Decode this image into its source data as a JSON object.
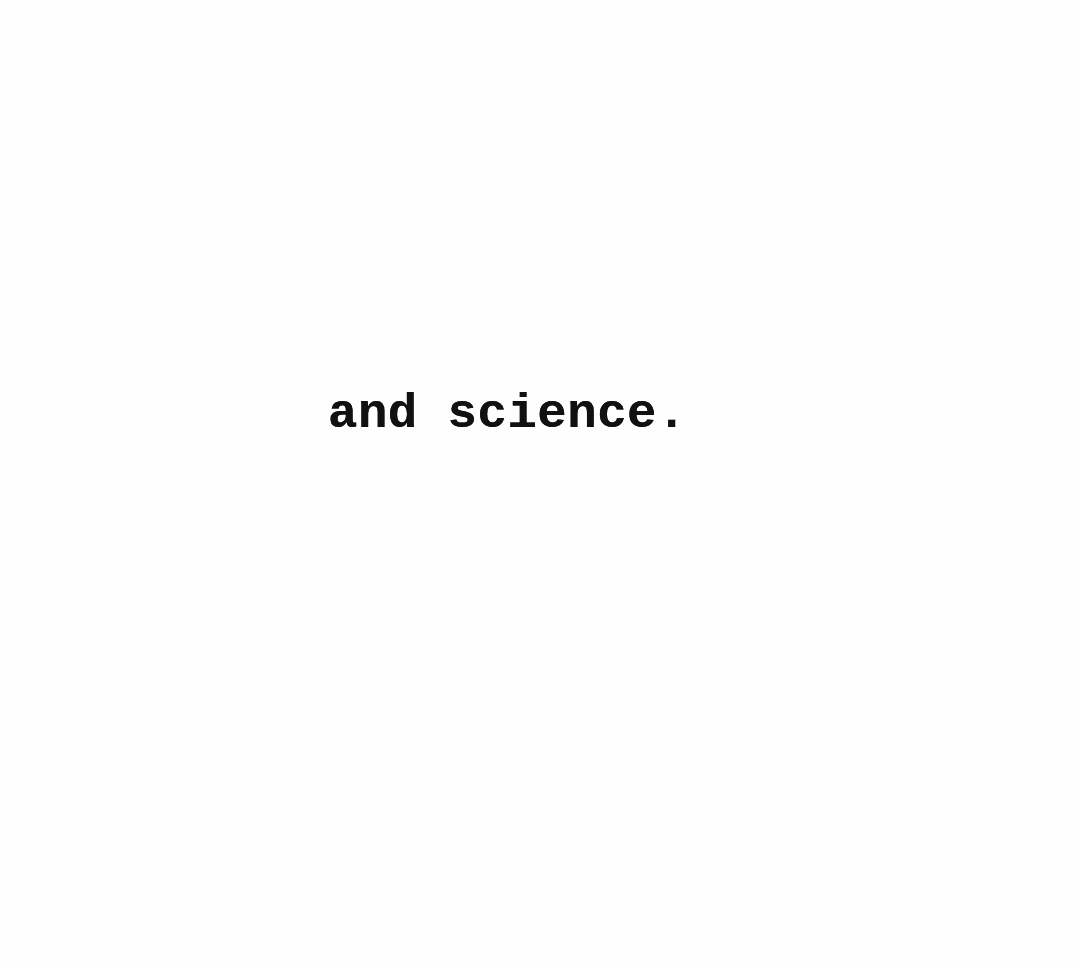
{
  "document": {
    "type": "scanned typewritten page",
    "lines": [
      {
        "text": "and science."
      }
    ]
  },
  "colors": {
    "paper": "#fefefe",
    "ink": "#111111"
  }
}
